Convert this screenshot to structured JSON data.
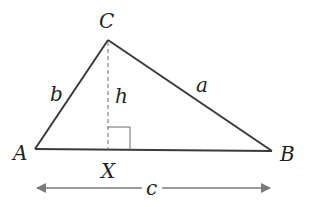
{
  "diagram": {
    "type": "triangle-with-altitude",
    "colors": {
      "stroke": "#3a3a3a",
      "arrow": "#7a7a7a",
      "text": "#1f1f1f",
      "background": "#ffffff"
    },
    "vertices": {
      "A": {
        "label": "A",
        "x": 35,
        "y": 149
      },
      "B": {
        "label": "B",
        "x": 272,
        "y": 151
      },
      "C": {
        "label": "C",
        "x": 108,
        "y": 40
      }
    },
    "foot": {
      "label": "X",
      "x": 108,
      "y": 150
    },
    "sides": {
      "a": {
        "label": "a",
        "from": "C",
        "to": "B"
      },
      "b": {
        "label": "b",
        "from": "A",
        "to": "C"
      },
      "c": {
        "label": "c",
        "from": "A",
        "to": "B"
      }
    },
    "altitude": {
      "label": "h",
      "from": "C",
      "to": "X",
      "style": "dashed"
    },
    "right_angle_marker": {
      "at": "X"
    },
    "dimension_arrow": {
      "label": "c",
      "y": 188,
      "x_start": 35,
      "x_end": 272
    }
  }
}
